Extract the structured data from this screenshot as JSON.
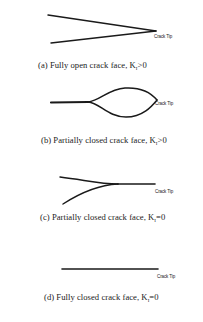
{
  "figure": {
    "tip_label": "Crack Tip",
    "line_color": "#1a1a1a",
    "panels": [
      {
        "id": "a",
        "caption_prefix": "(a) Fully open crack face, K",
        "caption_sub": "I",
        "caption_suffix": ">0"
      },
      {
        "id": "b",
        "caption_prefix": "(b) Partially closed crack face, K",
        "caption_sub": "I",
        "caption_suffix": ">0"
      },
      {
        "id": "c",
        "caption_prefix": "(c) Partially closed crack face, K",
        "caption_sub": "I",
        "caption_suffix": "=0"
      },
      {
        "id": "d",
        "caption_prefix": "(d) Fully closed crack face, K",
        "caption_sub": "I",
        "caption_suffix": "=0"
      }
    ]
  }
}
